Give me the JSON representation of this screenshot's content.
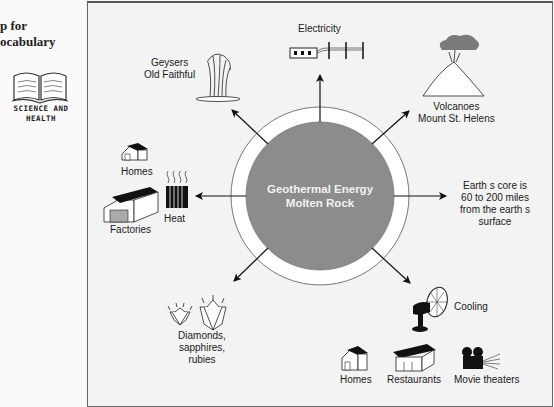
{
  "sidebar": {
    "title_lines": "p for\nocabulary",
    "badge": "SCIENCE AND\nHEALTH",
    "icon": "open-book-icon"
  },
  "center": {
    "line1": "Geothermal Energy",
    "line2": "Molten Rock",
    "fill_color": "#8c8c8c",
    "ring_color": "#ffffff"
  },
  "nodes": {
    "electricity": {
      "label": "Electricity",
      "icon": "power-lines-icon"
    },
    "geysers": {
      "line1": "Geysers",
      "line2": "Old Faithful",
      "icon": "geyser-icon"
    },
    "volcanoes": {
      "line1": "Volcanoes",
      "line2": "Mount St. Helens",
      "icon": "volcano-icon"
    },
    "heat": {
      "label": "Heat",
      "icon": "radiator-icon"
    },
    "heat_homes": {
      "label": "Homes",
      "icon": "house-icon"
    },
    "factories": {
      "label": "Factories",
      "icon": "factory-icon"
    },
    "core_depth": {
      "line1": "Earth s core is",
      "line2": "60 to 200 miles",
      "line3": "from the earth s",
      "line4": "surface"
    },
    "gems": {
      "line1": "Diamonds,",
      "line2": "sapphires,",
      "line3": "rubies",
      "icon": "gem-icon"
    },
    "cooling": {
      "label": "Cooling",
      "icon": "fan-icon"
    },
    "cool_homes": {
      "label": "Homes",
      "icon": "house-icon"
    },
    "restaurants": {
      "label": "Restaurants",
      "icon": "restaurant-icon"
    },
    "movie_theaters": {
      "label": "Movie theaters",
      "icon": "movie-projector-icon"
    }
  }
}
